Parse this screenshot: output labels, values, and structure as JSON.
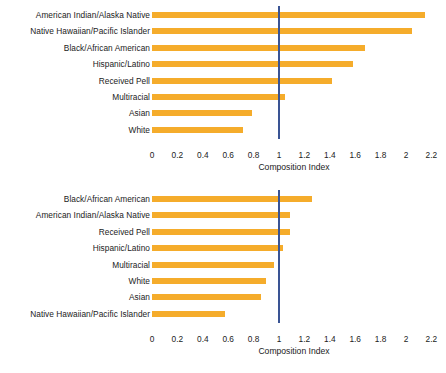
{
  "chart_data": [
    {
      "type": "bar",
      "orientation": "horizontal",
      "title": "",
      "xlabel": "Composition Index",
      "ylabel": "",
      "xlim": [
        0,
        2.3
      ],
      "xticks": [
        0,
        0.2,
        0.4,
        0.6,
        0.8,
        1,
        1.2,
        1.4,
        1.6,
        1.8,
        2,
        2.2
      ],
      "xticklabels": [
        "0",
        "0.2",
        "0.4",
        "0.6",
        "0.8",
        "1",
        "1.2",
        "1.4",
        "1.6",
        "1.8",
        "2",
        "2.2"
      ],
      "grid": false,
      "legend": null,
      "reference_line": {
        "value": 1.0,
        "color": "#3A5494",
        "orientation": "vertical"
      },
      "bar_color": "#F5AC2B",
      "categories": [
        "American Indian/Alaska Native",
        "Native Hawaiian/Pacific Islander",
        "Black/African American",
        "Hispanic/Latino",
        "Received Pell",
        "Multiracial",
        "Asian",
        "White"
      ],
      "values": [
        2.15,
        2.05,
        1.68,
        1.58,
        1.42,
        1.05,
        0.79,
        0.72
      ]
    },
    {
      "type": "bar",
      "orientation": "horizontal",
      "title": "",
      "xlabel": "Composition Index",
      "ylabel": "",
      "xlim": [
        0,
        2.3
      ],
      "xticks": [
        0,
        0.2,
        0.4,
        0.6,
        0.8,
        1,
        1.2,
        1.4,
        1.6,
        1.8,
        2,
        2.2
      ],
      "xticklabels": [
        "0",
        "0.2",
        "0.4",
        "0.6",
        "0.8",
        "1",
        "1.2",
        "1.4",
        "1.6",
        "1.8",
        "2",
        "2.2"
      ],
      "grid": false,
      "legend": null,
      "reference_line": {
        "value": 1.0,
        "color": "#3A5494",
        "orientation": "vertical"
      },
      "bar_color": "#F5AC2B",
      "categories": [
        "Black/African American",
        "American Indian/Alaska Native",
        "Received Pell",
        "Hispanic/Latino",
        "Multiracial",
        "White",
        "Asian",
        "Native Hawaiian/Pacific Islander"
      ],
      "values": [
        1.26,
        1.09,
        1.09,
        1.03,
        0.96,
        0.9,
        0.86,
        0.575
      ]
    }
  ]
}
